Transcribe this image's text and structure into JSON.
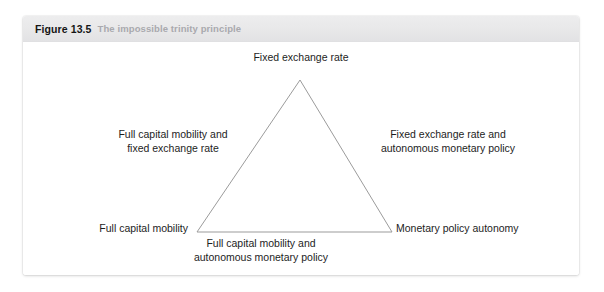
{
  "figure": {
    "number": "Figure 13.5",
    "caption": "The impossible trinity principle"
  },
  "diagram": {
    "type": "triangle",
    "vertices": [
      {
        "id": "apex",
        "label": "Fixed exchange rate"
      },
      {
        "id": "bottom-left",
        "label": "Full capital mobility"
      },
      {
        "id": "bottom-right",
        "label": "Monetary policy autonomy"
      }
    ],
    "edges": [
      {
        "id": "left-edge",
        "line1": "Full capital mobility and",
        "line2": "fixed exchange rate"
      },
      {
        "id": "right-edge",
        "line1": "Fixed exchange rate and",
        "line2": "autonomous monetary policy"
      },
      {
        "id": "base-edge",
        "line1": "Full capital mobility and",
        "line2": "autonomous monetary policy"
      }
    ]
  },
  "colors": {
    "header_background": "#e8e8e9",
    "figure_number_text": "#151515",
    "caption_text": "#a9a9ae",
    "triangle_stroke": "#9b9b9b",
    "label_text": "#1d1d1d",
    "card_background": "#ffffff"
  }
}
